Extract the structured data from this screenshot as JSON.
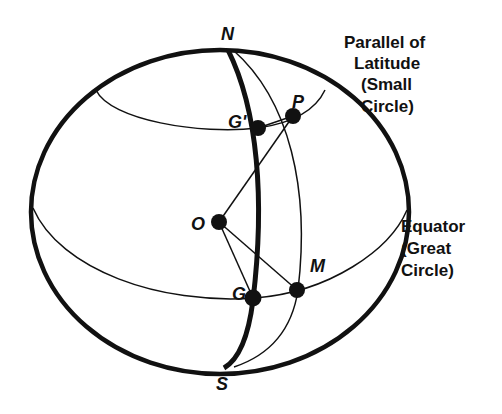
{
  "diagram": {
    "type": "sphere-geometry",
    "stroke_color": "#111111",
    "background": "#ffffff",
    "points": {
      "N": {
        "label": "N",
        "x": 228,
        "y": 34
      },
      "S": {
        "label": "S",
        "x": 224,
        "y": 390
      },
      "O": {
        "label": "O",
        "x": 198,
        "y": 229
      },
      "P": {
        "label": "P",
        "x": 300,
        "y": 108
      },
      "G_prime": {
        "label": "G'",
        "x": 231,
        "y": 128
      },
      "G": {
        "label": "G",
        "x": 209,
        "y": 300
      },
      "M": {
        "label": "M",
        "x": 318,
        "y": 270
      }
    },
    "annotations": {
      "parallel": {
        "line1": "Parallel of",
        "line2": "Latitude",
        "line3": "(Small",
        "line4": "Circle)"
      },
      "equator": {
        "line1": "Equator",
        "line2": "(Great",
        "line3": "Circle)"
      }
    }
  }
}
